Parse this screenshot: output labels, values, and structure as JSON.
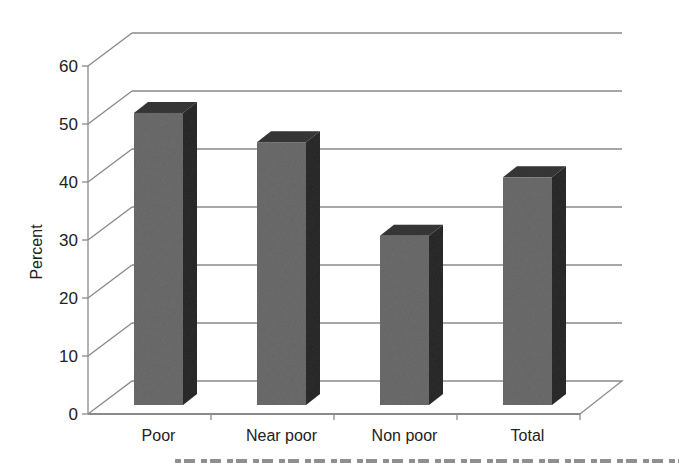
{
  "chart_data": {
    "type": "bar",
    "style": "3d-clustered-column",
    "title": "",
    "xlabel": "",
    "ylabel": "Percent",
    "categories": [
      "Poor",
      "Near poor",
      "Non poor",
      "Total"
    ],
    "values": [
      53,
      48,
      32,
      42
    ],
    "ylim": [
      0,
      60
    ],
    "yticks": [
      0,
      10,
      20,
      30,
      40,
      50,
      60
    ],
    "grid": true,
    "legend": null,
    "colors": {
      "bar_front": "#6f6f6f",
      "bar_side": "#2e2e2e",
      "bar_top": "#3a3a3a",
      "gridline": "#8a8a8a"
    }
  },
  "labels": {
    "ylabel": "Percent",
    "yticks": [
      "0",
      "10",
      "20",
      "30",
      "40",
      "50",
      "60"
    ],
    "categories": [
      "Poor",
      "Near poor",
      "Non poor",
      "Total"
    ]
  }
}
